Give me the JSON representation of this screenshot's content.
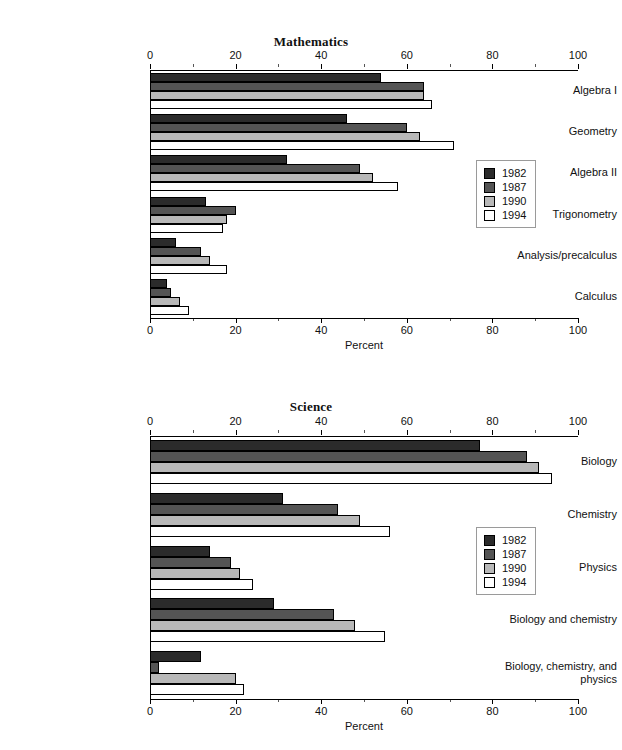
{
  "series_colors": {
    "1982": "#2b2b2b",
    "1987": "#545454",
    "1990": "#b8b8b8",
    "1994": "#ffffff"
  },
  "legend": {
    "entries": [
      "1982",
      "1987",
      "1990",
      "1994"
    ]
  },
  "chart_data": [
    {
      "type": "bar",
      "orientation": "horizontal",
      "title": "Mathematics",
      "xlabel": "Percent",
      "ylabel": "",
      "xlim": [
        0,
        100
      ],
      "xticks": [
        0,
        20,
        40,
        60,
        80,
        100
      ],
      "xticklabels": [
        "0",
        "20",
        "40",
        "60",
        "80",
        "100"
      ],
      "grid": false,
      "legend_position": "right-middle",
      "categories": [
        "Algebra I",
        "Geometry",
        "Algebra II",
        "Trigonometry",
        "Analysis/precalculus",
        "Calculus"
      ],
      "series": [
        {
          "name": "1982",
          "values": [
            54,
            46,
            32,
            13,
            6,
            4
          ]
        },
        {
          "name": "1987",
          "values": [
            64,
            60,
            49,
            20,
            12,
            5
          ]
        },
        {
          "name": "1990",
          "values": [
            64,
            63,
            52,
            18,
            14,
            7
          ]
        },
        {
          "name": "1994",
          "values": [
            66,
            71,
            58,
            17,
            18,
            9
          ]
        }
      ]
    },
    {
      "type": "bar",
      "orientation": "horizontal",
      "title": "Science",
      "xlabel": "Percent",
      "ylabel": "",
      "xlim": [
        0,
        100
      ],
      "xticks": [
        0,
        20,
        40,
        60,
        80,
        100
      ],
      "xticklabels": [
        "0",
        "20",
        "40",
        "60",
        "80",
        "100"
      ],
      "grid": false,
      "legend_position": "right-middle",
      "categories": [
        "Biology",
        "Chemistry",
        "Physics",
        "Biology and chemistry",
        "Biology, chemistry, and physics"
      ],
      "series": [
        {
          "name": "1982",
          "values": [
            77,
            31,
            14,
            29,
            12
          ]
        },
        {
          "name": "1987",
          "values": [
            88,
            44,
            19,
            43,
            2
          ]
        },
        {
          "name": "1990",
          "values": [
            91,
            49,
            21,
            48,
            20
          ]
        },
        {
          "name": "1994",
          "values": [
            94,
            56,
            24,
            55,
            22
          ]
        }
      ]
    }
  ]
}
